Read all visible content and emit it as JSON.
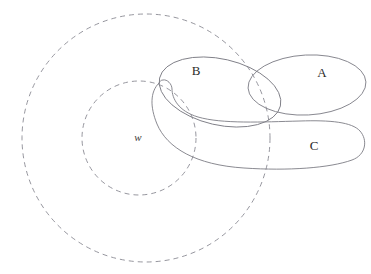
{
  "diagram": {
    "background_color": "#ffffff",
    "solid_stroke_color": "#7d7d85",
    "dashed_stroke_color": "#8a8a93",
    "label_color": "#2b2b2b",
    "stroke_width": 0.9,
    "dash_pattern": "5 4",
    "labels": [
      {
        "id": "label-A",
        "text": "A",
        "x": 322,
        "y": 74,
        "style": "upright"
      },
      {
        "id": "label-B",
        "text": "B",
        "x": 196,
        "y": 72,
        "style": "upright"
      },
      {
        "id": "label-C",
        "text": "C",
        "x": 314,
        "y": 147,
        "style": "upright"
      },
      {
        "id": "label-w",
        "text": "w",
        "x": 138,
        "y": 138,
        "style": "italic"
      }
    ],
    "dashed_circles": [
      {
        "id": "outer-universe",
        "cx": 146,
        "cy": 138,
        "r": 124
      },
      {
        "id": "inner-universe",
        "cx": 139,
        "cy": 138,
        "r": 57
      }
    ],
    "solid_shapes": [
      {
        "id": "set-A-ellipse",
        "kind": "ellipse",
        "cx": 307,
        "cy": 85,
        "rx": 59,
        "ry": 30,
        "rotation": -3
      },
      {
        "id": "set-B-ellipse",
        "kind": "ellipse",
        "cx": 220,
        "cy": 92,
        "rx": 62,
        "ry": 33,
        "rotation": 13
      },
      {
        "id": "set-C-tube",
        "kind": "bent-tube",
        "description": "long curved closed band sweeping from upper-left down and across to the right with a rounded right cap"
      }
    ]
  }
}
